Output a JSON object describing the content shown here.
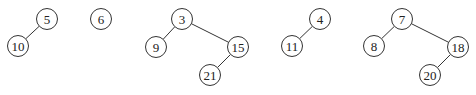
{
  "diagram": {
    "title": "",
    "style": {
      "stroke": "#333333",
      "fill": "#ffffff",
      "text": "#222222",
      "node_radius": 10.5
    },
    "trees": [
      {
        "root": "5",
        "nodes": [
          {
            "id": "n5",
            "label": "5",
            "x": 47,
            "y": 19
          },
          {
            "id": "n10",
            "label": "10",
            "x": 18,
            "y": 46
          }
        ],
        "edges": [
          {
            "from": "n5",
            "to": "n10"
          }
        ]
      },
      {
        "root": "6",
        "nodes": [
          {
            "id": "n6",
            "label": "6",
            "x": 101,
            "y": 19
          }
        ],
        "edges": []
      },
      {
        "root": "3",
        "nodes": [
          {
            "id": "n3",
            "label": "3",
            "x": 182,
            "y": 19
          },
          {
            "id": "n9",
            "label": "9",
            "x": 156,
            "y": 47
          },
          {
            "id": "n15",
            "label": "15",
            "x": 238,
            "y": 47
          },
          {
            "id": "n21",
            "label": "21",
            "x": 210,
            "y": 75
          }
        ],
        "edges": [
          {
            "from": "n3",
            "to": "n9"
          },
          {
            "from": "n3",
            "to": "n15"
          },
          {
            "from": "n15",
            "to": "n21"
          }
        ]
      },
      {
        "root": "4",
        "nodes": [
          {
            "id": "n4",
            "label": "4",
            "x": 320,
            "y": 19
          },
          {
            "id": "n11",
            "label": "11",
            "x": 292,
            "y": 46
          }
        ],
        "edges": [
          {
            "from": "n4",
            "to": "n11"
          }
        ]
      },
      {
        "root": "7",
        "nodes": [
          {
            "id": "n7",
            "label": "7",
            "x": 402,
            "y": 19
          },
          {
            "id": "n8",
            "label": "8",
            "x": 374,
            "y": 46
          },
          {
            "id": "n18",
            "label": "18",
            "x": 458,
            "y": 47
          },
          {
            "id": "n20",
            "label": "20",
            "x": 430,
            "y": 75
          }
        ],
        "edges": [
          {
            "from": "n7",
            "to": "n8"
          },
          {
            "from": "n7",
            "to": "n18"
          },
          {
            "from": "n18",
            "to": "n20"
          }
        ]
      }
    ]
  }
}
